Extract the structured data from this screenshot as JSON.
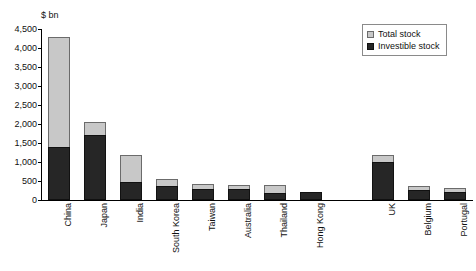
{
  "chart_data": {
    "type": "bar",
    "title": "",
    "subtitle": "",
    "unit_label": "$ bn",
    "xlabel": "",
    "ylabel": "",
    "ylim": [
      0,
      4500
    ],
    "ytick_step": 500,
    "grid": false,
    "stacked": false,
    "legend_position": "top-right",
    "note": "Light grey bar shows Total stock (full column height); black bar shows Investible stock drawn in front, sharing the same baseline.",
    "ytick_labels": [
      "0",
      "500",
      "1,000",
      "1,500",
      "2,000",
      "2,500",
      "3,000",
      "3,500",
      "4,000",
      "4,500"
    ],
    "ytick_values": [
      0,
      500,
      1000,
      1500,
      2000,
      2500,
      3000,
      3500,
      4000,
      4500
    ],
    "categories": [
      "China",
      "Japan",
      "India",
      "South Korea",
      "Taiwan",
      "Australia",
      "Thailand",
      "Hong Kong",
      "",
      "UK",
      "Belgium",
      "Portugal"
    ],
    "series": [
      {
        "name": "Total stock",
        "color": "#c8c8c8",
        "values": [
          4290,
          2050,
          1190,
          550,
          420,
          395,
          395,
          210,
          null,
          1190,
          370,
          315
        ]
      },
      {
        "name": "Investible stock",
        "color": "#262626",
        "values": [
          1400,
          1700,
          480,
          370,
          290,
          290,
          185,
          210,
          null,
          1000,
          260,
          210
        ]
      }
    ],
    "legend": [
      {
        "label": "Total stock",
        "swatch": "light-grey"
      },
      {
        "label": "Investible stock",
        "swatch": "black"
      }
    ]
  }
}
